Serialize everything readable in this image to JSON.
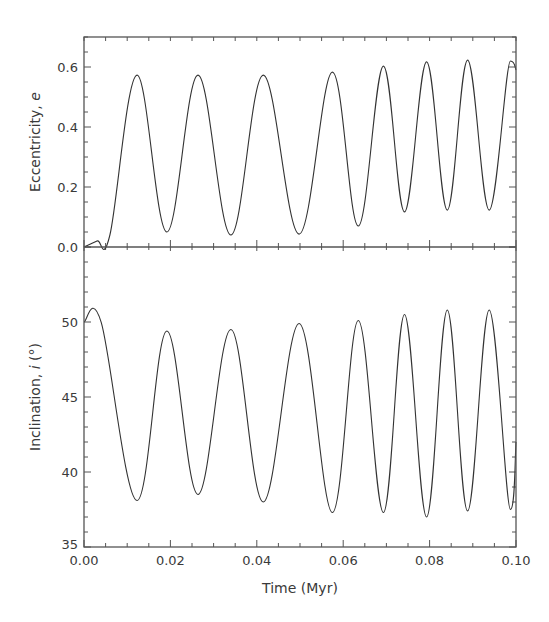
{
  "chart_data": {
    "type": "line",
    "layout": "two vertically stacked panels sharing x-axis",
    "xlabel": "Time (Myr)",
    "xlim": [
      0.0,
      0.1
    ],
    "xticks": [
      "0.00",
      "0.02",
      "0.04",
      "0.06",
      "0.08",
      "0.10"
    ],
    "grid": false,
    "legend": "none",
    "panels": [
      {
        "name": "eccentricity",
        "ylabel": "Eccentricity, e",
        "ylabel_main": "Eccentricity, ",
        "ylabel_symbol": "e",
        "ylim": [
          0.0,
          0.7
        ],
        "yticks": [
          "0.0",
          "0.2",
          "0.4",
          "0.6"
        ],
        "series": [
          {
            "name": "e",
            "x": [
              0.0,
              0.003,
              0.006,
              0.0123,
              0.0192,
              0.0264,
              0.034,
              0.0415,
              0.0498,
              0.0575,
              0.0635,
              0.0693,
              0.0742,
              0.0793,
              0.0841,
              0.0888,
              0.0938,
              0.0987,
              0.1
            ],
            "y": [
              0.0,
              0.02,
              0.04,
              0.573,
              0.05,
              0.573,
              0.04,
              0.573,
              0.043,
              0.583,
              0.07,
              0.603,
              0.117,
              0.617,
              0.123,
              0.623,
              0.123,
              0.62,
              0.59
            ]
          }
        ]
      },
      {
        "name": "inclination",
        "ylabel": "Inclination, i (°)",
        "ylabel_main": "Inclination, ",
        "ylabel_symbol": "i",
        "ylabel_unit": " (°)",
        "ylim": [
          35,
          55
        ],
        "yticks": [
          "35",
          "40",
          "45",
          "50"
        ],
        "series": [
          {
            "name": "i",
            "x": [
              0.0,
              0.004,
              0.0123,
              0.0192,
              0.0264,
              0.034,
              0.0415,
              0.0498,
              0.0575,
              0.0635,
              0.0693,
              0.0742,
              0.0793,
              0.0841,
              0.0888,
              0.0938,
              0.0987,
              0.1
            ],
            "y": [
              50.0,
              49.95,
              38.1,
              49.4,
              38.5,
              49.5,
              38.0,
              49.9,
              37.3,
              50.1,
              37.3,
              50.5,
              37.0,
              50.8,
              37.4,
              50.8,
              37.5,
              42.0
            ]
          }
        ]
      }
    ]
  }
}
